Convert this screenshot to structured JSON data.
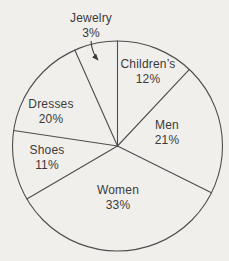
{
  "page": {
    "background": "#f1efec"
  },
  "chart": {
    "stroke_color": "#4d4d4d",
    "text_color": "#3a3a3a",
    "stroke_width": 1.1,
    "center": {
      "x": 117.5,
      "y": 146
    },
    "radius": 105,
    "label_line_height": 15,
    "arrow": {
      "from": {
        "x": 91,
        "y": 41
      },
      "ctrl": {
        "x": 92,
        "y": 53
      },
      "to": {
        "x": 98,
        "y": 60
      }
    }
  },
  "chart_data": {
    "type": "pie",
    "title": "",
    "unit": "percent",
    "direction": "clockwise",
    "start_angle_deg_from_top": 0,
    "legend": "none",
    "fill": "none",
    "categories": [
      "Children’s",
      "Men",
      "Women",
      "Shoes",
      "Dresses",
      "Jewelry"
    ],
    "values": [
      12,
      21,
      33,
      11,
      20,
      3
    ],
    "slices": [
      {
        "label": "Children’s",
        "pct_label": "12%",
        "value": 12,
        "label_x": 148,
        "label_y": 68
      },
      {
        "label": "Men",
        "pct_label": "21%",
        "value": 21,
        "label_x": 167,
        "label_y": 129
      },
      {
        "label": "Women",
        "pct_label": "33%",
        "value": 33,
        "label_x": 118,
        "label_y": 194
      },
      {
        "label": "Shoes",
        "pct_label": "11%",
        "value": 11,
        "label_x": 47,
        "label_y": 154
      },
      {
        "label": "Dresses",
        "pct_label": "20%",
        "value": 20,
        "label_x": 51,
        "label_y": 108
      },
      {
        "label": "Jewelry",
        "pct_label": "3%",
        "value": 3,
        "label_x": 91,
        "label_y": 22,
        "label_outside": true
      }
    ],
    "drawn_start_angles_deg": [
      90,
      46.8,
      -26.5,
      210.3,
      171.5,
      114
    ]
  }
}
